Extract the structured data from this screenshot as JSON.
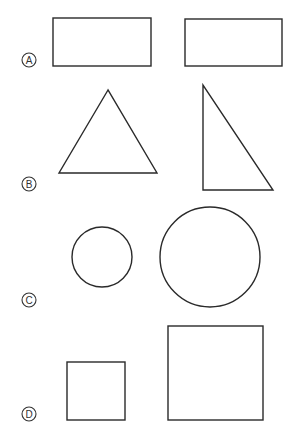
{
  "options": [
    {
      "letter": "A",
      "label_pos": {
        "cx": 29,
        "cy": 60
      },
      "shapes": [
        {
          "type": "rectangle",
          "x": 53,
          "y": 18,
          "w": 98,
          "h": 48
        },
        {
          "type": "rectangle",
          "x": 185,
          "y": 19,
          "w": 97,
          "h": 47
        }
      ]
    },
    {
      "letter": "B",
      "label_pos": {
        "cx": 29,
        "cy": 184
      },
      "shapes": [
        {
          "type": "triangle",
          "points": "108,90 59,173 157,173"
        },
        {
          "type": "right-triangle",
          "points": "203,85 203,190 273,190"
        }
      ]
    },
    {
      "letter": "C",
      "label_pos": {
        "cx": 29,
        "cy": 300
      },
      "shapes": [
        {
          "type": "circle",
          "cx": 102,
          "cy": 257,
          "r": 30
        },
        {
          "type": "circle",
          "cx": 210,
          "cy": 257,
          "r": 50
        }
      ]
    },
    {
      "letter": "D",
      "label_pos": {
        "cx": 29,
        "cy": 414
      },
      "shapes": [
        {
          "type": "square",
          "x": 67,
          "y": 362,
          "w": 58,
          "h": 58
        },
        {
          "type": "square",
          "x": 168,
          "y": 326,
          "w": 95,
          "h": 94
        }
      ]
    }
  ],
  "colors": {
    "stroke": "#2a2a2a",
    "background": "#ffffff"
  }
}
